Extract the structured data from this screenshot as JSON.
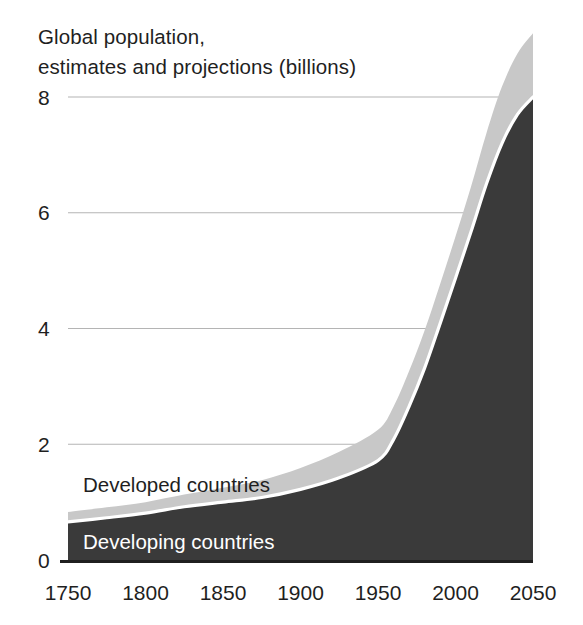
{
  "chart_data": {
    "type": "area",
    "title": "Global population, estimates and projections (billions)",
    "title_lines": [
      "Global population,",
      "estimates and projections (billions)"
    ],
    "xlabel": "",
    "ylabel": "",
    "stacked": true,
    "grid": true,
    "legend_position": "inline-labels",
    "xlim": [
      1750,
      2050
    ],
    "ylim": [
      0,
      8
    ],
    "xticks": [
      1750,
      1800,
      1850,
      1900,
      1950,
      2000,
      2050
    ],
    "xtick_labels": [
      "1750",
      "1800",
      "1850",
      "1900",
      "1950",
      "2000",
      "2050"
    ],
    "yticks": [
      0,
      2,
      4,
      6,
      8
    ],
    "ytick_labels": [
      "0",
      "2",
      "4",
      "6",
      "8"
    ],
    "x": [
      1750,
      1775,
      1800,
      1825,
      1850,
      1875,
      1900,
      1925,
      1950,
      1960,
      1970,
      1980,
      1990,
      2000,
      2010,
      2020,
      2030,
      2040,
      2050
    ],
    "series": [
      {
        "name": "Developing countries",
        "color": "#3a3a3a",
        "values": [
          0.66,
          0.73,
          0.81,
          0.92,
          1.0,
          1.08,
          1.22,
          1.42,
          1.72,
          2.08,
          2.65,
          3.31,
          4.08,
          4.87,
          5.67,
          6.5,
          7.2,
          7.7,
          8.0
        ]
      },
      {
        "name": "Developed countries",
        "color": "#c8c8c8",
        "values": [
          0.17,
          0.18,
          0.19,
          0.21,
          0.25,
          0.3,
          0.37,
          0.45,
          0.53,
          0.57,
          0.61,
          0.65,
          0.68,
          0.72,
          0.78,
          0.88,
          0.98,
          1.05,
          1.1
        ]
      }
    ],
    "totals": [
      0.83,
      0.91,
      1.0,
      1.13,
      1.25,
      1.38,
      1.59,
      1.87,
      2.25,
      2.65,
      3.26,
      3.96,
      4.76,
      5.59,
      6.45,
      7.38,
      8.18,
      8.75,
      9.1
    ],
    "annotations": [
      {
        "text": "Developed countries",
        "x_px": 83,
        "y_px": 492,
        "style": "dark"
      },
      {
        "text": "Developing countries",
        "x_px": 83,
        "y_px": 549,
        "style": "light"
      }
    ],
    "colors": {
      "developing": "#3a3a3a",
      "developed": "#c8c8c8",
      "gridline": "#b4b4b4",
      "divider": "#ffffff",
      "background": "#ffffff",
      "text": "#1f1f1f"
    }
  }
}
